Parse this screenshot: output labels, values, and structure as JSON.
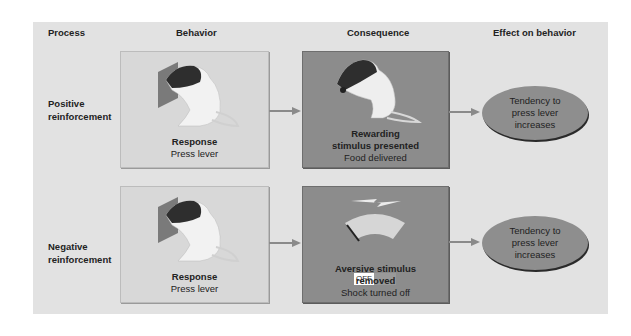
{
  "headers": {
    "process": "Process",
    "behavior": "Behavior",
    "consequence": "Consequence",
    "effect": "Effect on behavior"
  },
  "rows": [
    {
      "process": "Positive reinforcement",
      "behavior": {
        "title": "Response",
        "detail": "Press lever"
      },
      "consequence": {
        "title": "Rewarding stimulus presented",
        "detail": "Food delivered"
      },
      "effect": "Tendency to press lever increases"
    },
    {
      "process": "Negative reinforcement",
      "behavior": {
        "title": "Response",
        "detail": "Press lever"
      },
      "consequence": {
        "title": "Aversive stimulus removed",
        "detail": "Shock turned off",
        "switch_label": "OFF"
      },
      "effect": "Tendency to press lever increases"
    }
  ],
  "colors": {
    "panel": "#e2e2e2",
    "behavior_box": "#d8d8d8",
    "consequence_box": "#8c8c8c",
    "ellipse": "#8e8e8e"
  }
}
